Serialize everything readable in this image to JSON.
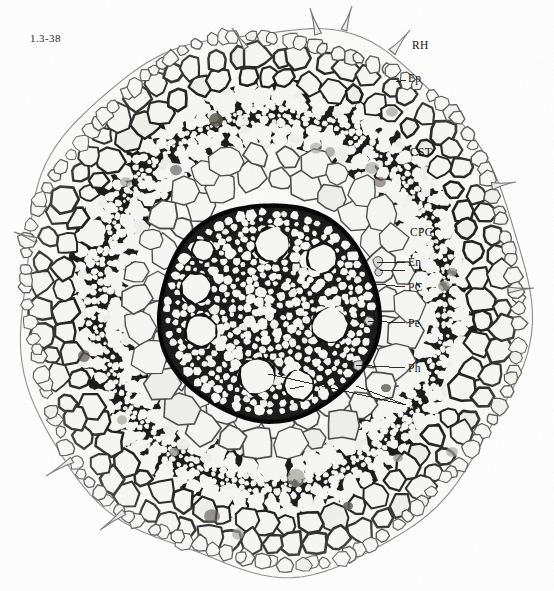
{
  "figure": {
    "plate_number": "1.3-38",
    "plate_number_pos": {
      "x": 30,
      "y": 32
    },
    "width": 554,
    "height": 591,
    "background_color": "#ffffff",
    "tone_colors": {
      "lumen_white": "#f7f7f5",
      "lumen_light": "#efefec",
      "wall_dark": "#0d0d0d",
      "wall_mid": "#454545",
      "wall_light": "#8f8f8f",
      "outline_grey": "#6e6e6e",
      "stain_grey": "#9a9a94",
      "stain_dark": "#5a564f"
    }
  },
  "annotations": [
    {
      "id": "RH",
      "label": "RH",
      "name": "root-hair",
      "label_pos": {
        "x": 412,
        "y": 40
      },
      "leader": null
    },
    {
      "id": "Ep",
      "label": "Ep",
      "name": "epidermis",
      "label_pos": {
        "x": 408,
        "y": 73
      },
      "leader": {
        "x1": 406,
        "y1": 80,
        "x2": 396,
        "y2": 82
      }
    },
    {
      "id": "CST",
      "label": "CST",
      "name": "cortex-sclerenchyma-tissue",
      "label_pos": {
        "x": 410,
        "y": 147
      },
      "leader": null
    },
    {
      "id": "CPC",
      "label": "CPC",
      "name": "cortex-parenchyma-cells",
      "label_pos": {
        "x": 410,
        "y": 227
      },
      "leader": null
    },
    {
      "id": "En",
      "label": "En",
      "name": "endodermis",
      "label_pos": {
        "x": 408,
        "y": 257
      },
      "leader": {
        "x1": 405,
        "y1": 262,
        "x2": 377,
        "y2": 262
      }
    },
    {
      "id": "PC",
      "label": "PC",
      "name": "passage-cell",
      "label_pos": {
        "x": 408,
        "y": 282
      },
      "leader": {
        "x1": 405,
        "y1": 287,
        "x2": 376,
        "y2": 284
      }
    },
    {
      "id": "Pe",
      "label": "Pe",
      "name": "pericycle",
      "label_pos": {
        "x": 408,
        "y": 318
      },
      "leader": {
        "x1": 405,
        "y1": 323,
        "x2": 368,
        "y2": 321
      }
    },
    {
      "id": "Ph",
      "label": "Ph",
      "name": "phloem",
      "label_pos": {
        "x": 408,
        "y": 363
      },
      "leader": {
        "x1": 405,
        "y1": 368,
        "x2": 356,
        "y2": 365
      }
    },
    {
      "id": "X",
      "label": "X",
      "name": "xylem",
      "label_pos": {
        "x": 410,
        "y": 400
      },
      "leader": {
        "x1": 406,
        "y1": 405,
        "x2": 300,
        "y2": 381
      }
    }
  ],
  "second_leaders": [
    {
      "name": "endodermis-leader-2",
      "x1": 405,
      "y1": 270,
      "x2": 380,
      "y2": 271
    },
    {
      "name": "xylem-leader-2",
      "x1": 406,
      "y1": 405,
      "x2": 356,
      "y2": 386
    },
    {
      "name": "xylem-inner-pointer-1",
      "x1": 300,
      "y1": 381,
      "x2": 268,
      "y2": 374
    },
    {
      "name": "xylem-inner-pointer-2",
      "x1": 304,
      "y1": 386,
      "x2": 290,
      "y2": 389
    }
  ],
  "structure": {
    "root_center": {
      "x": 272,
      "y": 300
    },
    "root_radius_x": 254,
    "root_radius_y": 272,
    "epidermis_band": {
      "inner": 0.93,
      "outer": 1.0
    },
    "outer_cortex_band": {
      "inner": 0.78,
      "outer": 0.945
    },
    "sclerenchyma_band": {
      "inner": 0.56,
      "outer": 0.8
    },
    "inner_cortex_band": {
      "inner": 0.405,
      "outer": 0.575
    },
    "stele": {
      "center": {
        "x": 269,
        "y": 312
      },
      "radius_x": 110,
      "radius_y": 108,
      "endodermis_thickness": 9
    },
    "metaxylem_vessels": [
      {
        "cx": 272,
        "cy": 244,
        "r": 16
      },
      {
        "cx": 322,
        "cy": 258,
        "r": 14
      },
      {
        "cx": 203,
        "cy": 250,
        "r": 10
      },
      {
        "cx": 196,
        "cy": 288,
        "r": 14
      },
      {
        "cx": 330,
        "cy": 326,
        "r": 17
      },
      {
        "cx": 201,
        "cy": 331,
        "r": 15
      },
      {
        "cx": 257,
        "cy": 376,
        "r": 17
      },
      {
        "cx": 299,
        "cy": 385,
        "r": 14
      }
    ],
    "root_hairs": [
      {
        "bx": 318,
        "by": 34,
        "ex": 310,
        "ey": 8,
        "w": 7
      },
      {
        "bx": 344,
        "by": 30,
        "ex": 352,
        "ey": 6,
        "w": 6
      },
      {
        "bx": 392,
        "by": 52,
        "ex": 410,
        "ey": 30,
        "w": 8
      },
      {
        "bx": 246,
        "by": 48,
        "ex": 232,
        "ey": 28,
        "w": 5
      },
      {
        "bx": 492,
        "by": 186,
        "ex": 516,
        "ey": 182,
        "w": 7
      },
      {
        "bx": 508,
        "by": 290,
        "ex": 534,
        "ey": 288,
        "w": 6
      },
      {
        "bx": 72,
        "by": 460,
        "ex": 46,
        "ey": 476,
        "w": 6
      },
      {
        "bx": 124,
        "by": 512,
        "ex": 100,
        "ey": 530,
        "w": 6
      },
      {
        "bx": 36,
        "by": 240,
        "ex": 14,
        "ey": 232,
        "w": 5
      }
    ],
    "stain_spots": [
      {
        "cx": 216,
        "cy": 120,
        "r": 7
      },
      {
        "cx": 316,
        "cy": 148,
        "r": 6
      },
      {
        "cx": 330,
        "cy": 152,
        "r": 5
      },
      {
        "cx": 176,
        "cy": 170,
        "r": 6
      },
      {
        "cx": 126,
        "cy": 182,
        "r": 6
      },
      {
        "cx": 372,
        "cy": 168,
        "r": 7
      },
      {
        "cx": 380,
        "cy": 182,
        "r": 6
      },
      {
        "cx": 444,
        "cy": 286,
        "r": 6
      },
      {
        "cx": 452,
        "cy": 272,
        "r": 5
      },
      {
        "cx": 84,
        "cy": 356,
        "r": 6
      },
      {
        "cx": 122,
        "cy": 420,
        "r": 5
      },
      {
        "cx": 296,
        "cy": 478,
        "r": 9
      },
      {
        "cx": 212,
        "cy": 516,
        "r": 8
      },
      {
        "cx": 238,
        "cy": 534,
        "r": 6
      },
      {
        "cx": 174,
        "cy": 452,
        "r": 5
      },
      {
        "cx": 386,
        "cy": 388,
        "r": 5
      },
      {
        "cx": 398,
        "cy": 458,
        "r": 5
      },
      {
        "cx": 452,
        "cy": 452,
        "r": 6
      },
      {
        "cx": 348,
        "cy": 506,
        "r": 5
      },
      {
        "cx": 392,
        "cy": 112,
        "r": 6
      }
    ]
  },
  "legend_terms": {
    "RH": "Root hair",
    "Ep": "Epidermis",
    "CST": "Cortex sclerenchyma tissue",
    "CPC": "Cortex parenchyma cells",
    "En": "Endodermis",
    "PC": "Passage cell",
    "Pe": "Pericycle",
    "Ph": "Phloem",
    "X": "Xylem"
  }
}
